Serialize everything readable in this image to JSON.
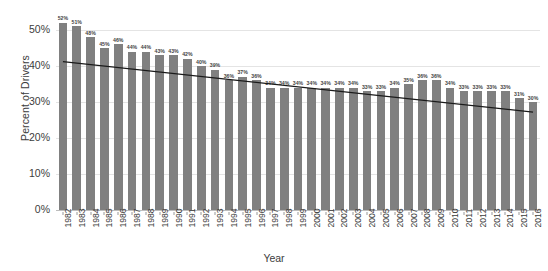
{
  "chart_data": {
    "type": "bar",
    "title": "",
    "xlabel": "Year",
    "ylabel": "Percent of Drivers",
    "ylim": [
      0,
      55
    ],
    "ytick_values": [
      0,
      10,
      20,
      30,
      40,
      50
    ],
    "ytick_labels": [
      "0%",
      "10%",
      "20%",
      "30%",
      "40%",
      "50%"
    ],
    "grid": true,
    "legend": "none",
    "bar_color": "#808080",
    "trendline_color": "#1a1a1a",
    "categories": [
      "1982",
      "1983",
      "1984",
      "1985",
      "1986",
      "1987",
      "1988",
      "1989",
      "1990",
      "1991",
      "1992",
      "1993",
      "1994",
      "1995",
      "1996",
      "1997",
      "1998",
      "1999",
      "2000",
      "2001",
      "2002",
      "2003",
      "2004",
      "2005",
      "2006",
      "2007",
      "2008",
      "2009",
      "2010",
      "2011",
      "2012",
      "2013",
      "2014",
      "2015",
      "2016"
    ],
    "values": [
      52,
      51,
      48,
      45,
      46,
      44,
      44,
      43,
      43,
      42,
      40,
      39,
      36,
      37,
      36,
      34,
      34,
      34,
      34,
      34,
      34,
      34,
      33,
      33,
      34,
      35,
      36,
      36,
      34,
      33,
      33,
      33,
      33,
      31,
      30
    ],
    "value_labels": [
      "52%",
      "51%",
      "48%",
      "45%",
      "46%",
      "44%",
      "44%",
      "43%",
      "43%",
      "42%",
      "40%",
      "39%",
      "36%",
      "37%",
      "36%",
      "34%",
      "34%",
      "34%",
      "34%",
      "34%",
      "34%",
      "34%",
      "33%",
      "33%",
      "34%",
      "35%",
      "36%",
      "36%",
      "34%",
      "33%",
      "33%",
      "33%",
      "33%",
      "31%",
      "30%"
    ],
    "trendline": {
      "start_value": 41.2,
      "end_value": 27.2,
      "style": "linear"
    }
  }
}
